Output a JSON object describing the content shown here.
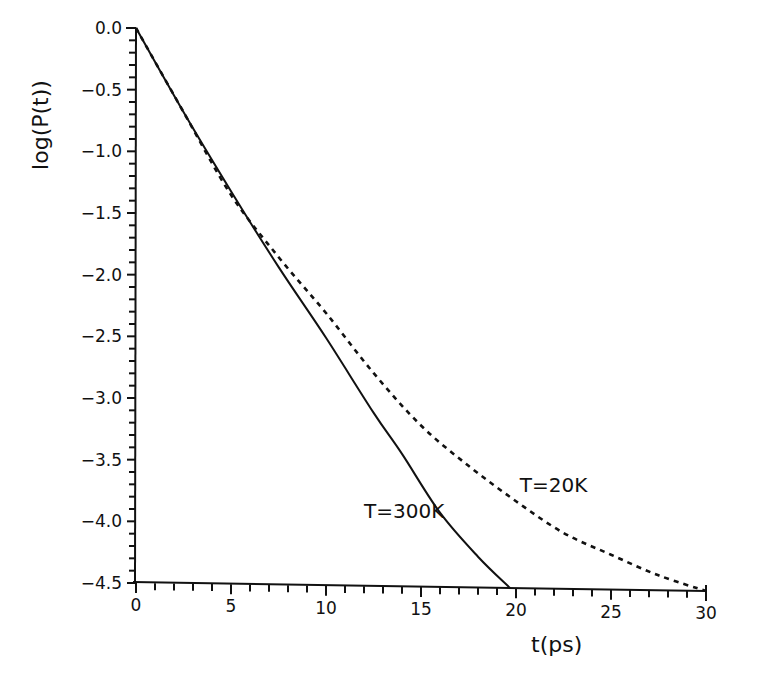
{
  "chart_data": {
    "type": "line",
    "title": "",
    "xlabel": "t(ps)",
    "ylabel": "log(P(t))",
    "xlim": [
      0,
      30
    ],
    "ylim": [
      -4.5,
      0.0
    ],
    "grid": false,
    "legend": "none (inline annotations)",
    "x_ticks": [
      "0",
      "5",
      "10",
      "15",
      "20",
      "25",
      "30"
    ],
    "x_tick_values": [
      0,
      5,
      10,
      15,
      20,
      25,
      30
    ],
    "y_ticks": [
      "0.0",
      "-0.5",
      "-1.0",
      "-1.5",
      "-2.0",
      "-2.5",
      "-3.0",
      "-3.5",
      "-4.0",
      "-4.5"
    ],
    "y_tick_values": [
      0.0,
      -0.5,
      -1.0,
      -1.5,
      -2.0,
      -2.5,
      -3.0,
      -3.5,
      -4.0,
      -4.5
    ],
    "series": [
      {
        "name": "T=300K",
        "style": "solid",
        "x": [
          0,
          2.5,
          5,
          7.5,
          10,
          12.5,
          14,
          16,
          18,
          19.7
        ],
        "y": [
          0.0,
          -0.68,
          -1.32,
          -1.93,
          -2.5,
          -3.1,
          -3.43,
          -3.9,
          -4.25,
          -4.5
        ]
      },
      {
        "name": "T=20K",
        "style": "dashed",
        "x": [
          0,
          2.5,
          5,
          7.5,
          10,
          12.5,
          15,
          17.5,
          20,
          22.5,
          25,
          27.5,
          30
        ],
        "y": [
          0.0,
          -0.68,
          -1.35,
          -1.85,
          -2.3,
          -2.78,
          -3.2,
          -3.52,
          -3.8,
          -4.05,
          -4.22,
          -4.38,
          -4.5
        ]
      }
    ],
    "annotations": [
      {
        "text": "T=300K",
        "x": 12.0,
        "y": -3.95
      },
      {
        "text": "T=20K",
        "x": 20.2,
        "y": -3.73
      }
    ]
  }
}
